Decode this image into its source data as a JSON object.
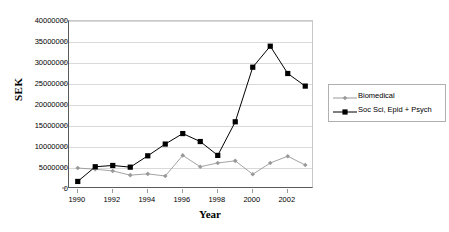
{
  "chart_data": {
    "type": "line",
    "title": "",
    "xlabel": "Year",
    "ylabel": "SEK",
    "x": [
      1990,
      1991,
      1992,
      1993,
      1994,
      1995,
      1996,
      1997,
      1998,
      1999,
      2000,
      2001,
      2002,
      2003
    ],
    "xticklabels": [
      "1990",
      "1992",
      "1994",
      "1996",
      "1998",
      "2000",
      "2002"
    ],
    "xtickvalues": [
      1990,
      1992,
      1994,
      1996,
      1998,
      2000,
      2002
    ],
    "xlim": [
      1989.5,
      2003.5
    ],
    "ylim": [
      0,
      40000000
    ],
    "yticklabels": [
      "0",
      "5000000",
      "10000000",
      "15000000",
      "20000000",
      "25000000",
      "30000000",
      "35000000",
      "40000000"
    ],
    "ytickvalues": [
      0,
      5000000,
      10000000,
      15000000,
      20000000,
      25000000,
      30000000,
      35000000,
      40000000
    ],
    "grid": true,
    "legend_position": "right",
    "series": [
      {
        "name": "Biomedical",
        "color": "#999999",
        "marker": "diamond",
        "values": [
          5000000,
          4700000,
          4300000,
          3300000,
          3600000,
          3100000,
          8000000,
          5300000,
          6200000,
          6700000,
          3500000,
          6200000,
          7800000,
          5700000
        ]
      },
      {
        "name": "Soc Sci, Epid + Psych",
        "color": "#000000",
        "marker": "square",
        "values": [
          1800000,
          5300000,
          5600000,
          5200000,
          7900000,
          10700000,
          13200000,
          11300000,
          8000000,
          16000000,
          29000000,
          34000000,
          27500000,
          24500000
        ]
      }
    ]
  },
  "legend": {
    "entries": [
      {
        "label": "Biomedical"
      },
      {
        "label": "Soc Sci, Epid + Psych"
      }
    ]
  },
  "axis_titles": {
    "x": "Year",
    "y": "SEK"
  }
}
